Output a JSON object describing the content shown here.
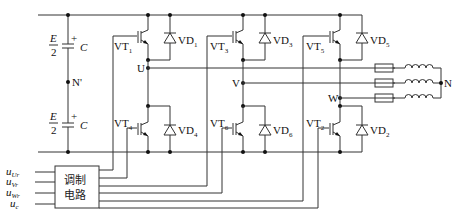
{
  "dc_source": {
    "upper_cap": {
      "voltage_num": "E",
      "voltage_den": "2",
      "plus": "+",
      "name": "C"
    },
    "lower_cap": {
      "voltage_num": "E",
      "voltage_den": "2",
      "plus": "+",
      "name": "C"
    },
    "midpoint": "N'"
  },
  "switches": [
    {
      "name": "VT",
      "sub": "1",
      "diode": "VD",
      "diode_sub": "1"
    },
    {
      "name": "VT",
      "sub": "3",
      "diode": "VD",
      "diode_sub": "3"
    },
    {
      "name": "VT",
      "sub": "5",
      "diode": "VD",
      "diode_sub": "5"
    },
    {
      "name": "VT",
      "sub": "4",
      "diode": "VD",
      "diode_sub": "4"
    },
    {
      "name": "VT",
      "sub": "6",
      "diode": "VD",
      "diode_sub": "6"
    },
    {
      "name": "VT",
      "sub": "2",
      "diode": "VD",
      "diode_sub": "2"
    }
  ],
  "phases": [
    "U",
    "V",
    "W"
  ],
  "load_neutral": "N",
  "modulator": {
    "label_line1": "调制",
    "label_line2": "电路",
    "inputs": [
      {
        "u": "u",
        "sub": "Ur"
      },
      {
        "u": "u",
        "sub": "Vr"
      },
      {
        "u": "u",
        "sub": "Wr"
      },
      {
        "u": "u",
        "sub": "c"
      }
    ]
  }
}
